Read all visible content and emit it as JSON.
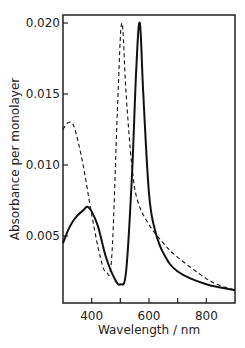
{
  "chart_data": {
    "type": "line",
    "title": "",
    "xlabel": "Wavelength / nm",
    "ylabel": "Absorbance per monolayer",
    "xlim": [
      300,
      900
    ],
    "ylim": [
      0,
      0.021
    ],
    "grid": false,
    "legend": null,
    "xticks": [
      400,
      500,
      600,
      700,
      800
    ],
    "xtick_labels": [
      "400",
      "",
      "600",
      "",
      "800"
    ],
    "yticks": [
      0.005,
      0.01,
      0.015,
      0.02
    ],
    "ytick_labels": [
      "0.005",
      "0.010",
      "0.015",
      "0.020"
    ],
    "series": [
      {
        "name": "solid",
        "style": "solid",
        "x": [
          300,
          320,
          340,
          370,
          390,
          420,
          450,
          480,
          500,
          520,
          540,
          555,
          568,
          580,
          600,
          620,
          650,
          700,
          800,
          900
        ],
        "y": [
          0.0045,
          0.0055,
          0.0062,
          0.0068,
          0.007,
          0.0058,
          0.0035,
          0.002,
          0.0016,
          0.0025,
          0.009,
          0.0165,
          0.02,
          0.015,
          0.008,
          0.0055,
          0.0038,
          0.0025,
          0.0016,
          0.0012
        ]
      },
      {
        "name": "dashed",
        "style": "dashed",
        "x": [
          300,
          320,
          340,
          370,
          400,
          430,
          450,
          470,
          490,
          505,
          520,
          540,
          560,
          600,
          650,
          700,
          800,
          850,
          900
        ],
        "y": [
          0.0125,
          0.013,
          0.0126,
          0.01,
          0.0065,
          0.0035,
          0.0025,
          0.0035,
          0.014,
          0.02,
          0.015,
          0.01,
          0.0075,
          0.0058,
          0.0045,
          0.0035,
          0.002,
          0.0015,
          0.0012
        ]
      }
    ]
  }
}
